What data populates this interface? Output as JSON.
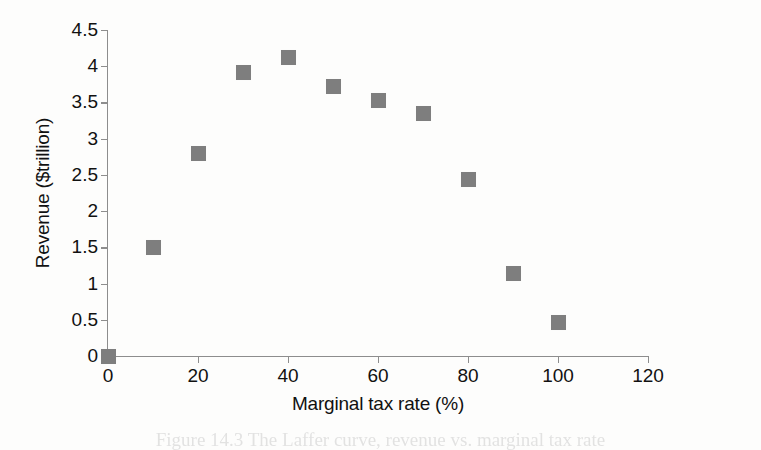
{
  "chart_data": {
    "type": "scatter",
    "title": "",
    "xlabel": "Marginal tax rate (%)",
    "ylabel": "Revenue ($trillion)",
    "xlim": [
      0,
      120
    ],
    "ylim": [
      0,
      4.5
    ],
    "xticks": [
      "0",
      "20",
      "40",
      "60",
      "80",
      "100",
      "120"
    ],
    "xtick_values": [
      0,
      20,
      40,
      60,
      80,
      100,
      120
    ],
    "yticks": [
      "0",
      "0.5",
      "1",
      "1.5",
      "2",
      "2.5",
      "3",
      "3.5",
      "4",
      "4.5"
    ],
    "ytick_values": [
      0,
      0.5,
      1,
      1.5,
      2,
      2.5,
      3,
      3.5,
      4,
      4.5
    ],
    "grid": false,
    "legend": false,
    "marker_color": "#7e7e7e",
    "marker_shape": "square",
    "x": [
      0,
      10,
      20,
      30,
      40,
      50,
      60,
      70,
      80,
      90,
      100
    ],
    "values": [
      0,
      1.5,
      2.8,
      3.92,
      4.12,
      3.72,
      3.53,
      3.35,
      2.44,
      1.14,
      0.46
    ],
    "points": [
      {
        "x": 0,
        "y": 0
      },
      {
        "x": 10,
        "y": 1.5
      },
      {
        "x": 20,
        "y": 2.8
      },
      {
        "x": 30,
        "y": 3.92
      },
      {
        "x": 40,
        "y": 4.12
      },
      {
        "x": 50,
        "y": 3.72
      },
      {
        "x": 60,
        "y": 3.53
      },
      {
        "x": 70,
        "y": 3.35
      },
      {
        "x": 80,
        "y": 2.44
      },
      {
        "x": 90,
        "y": 1.14
      },
      {
        "x": 100,
        "y": 0.46
      }
    ]
  },
  "caption": {
    "text": "Figure 14.3   The Laffer curve, revenue vs. marginal tax rate"
  },
  "colors": {
    "axis": "#8d8d8d",
    "text": "#111111",
    "marker": "#7e7e7e",
    "background": "#fdfdfc"
  }
}
